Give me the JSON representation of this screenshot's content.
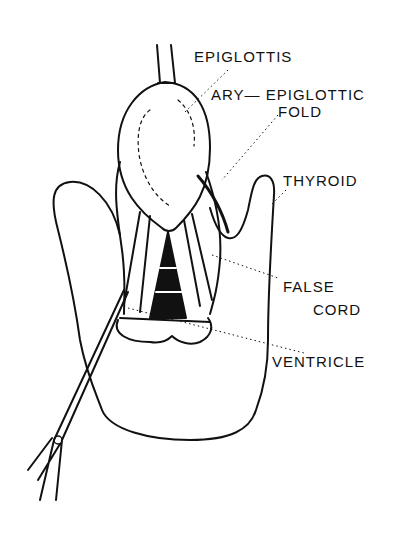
{
  "diagram": {
    "labels": {
      "epiglottis": "EPIGLOTTIS",
      "ary_epiglottic_line1": "ARY— EPIGLOTTIC",
      "ary_epiglottic_line2": "FOLD",
      "thyroid": "THYROID",
      "false_cord_line1": "FALSE",
      "false_cord_line2": "CORD",
      "ventricle": "VENTRICLE"
    },
    "colors": {
      "ink": "#111111",
      "background": "#ffffff"
    }
  }
}
